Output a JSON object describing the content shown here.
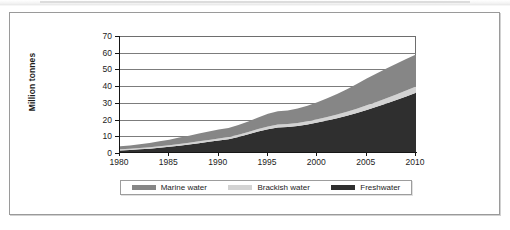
{
  "chart_data": {
    "type": "area",
    "stacked": true,
    "title": "",
    "subtitle": "",
    "xlabel": "",
    "ylabel": "Million tonnes",
    "xlim": [
      1980,
      2010
    ],
    "ylim": [
      0,
      70
    ],
    "grid": true,
    "legend_position": "bottom",
    "x_tick_labels": [
      "1980",
      "1985",
      "1990",
      "1995",
      "2000",
      "2005",
      "2010"
    ],
    "x_ticks": [
      1980,
      1985,
      1990,
      1995,
      2000,
      2005,
      2010
    ],
    "y_tick_labels": [
      "0",
      "10",
      "20",
      "30",
      "40",
      "50",
      "60",
      "70"
    ],
    "y_ticks": [
      0,
      10,
      20,
      30,
      40,
      50,
      60,
      70
    ],
    "x": [
      1980,
      1981,
      1982,
      1983,
      1984,
      1985,
      1986,
      1987,
      1988,
      1989,
      1990,
      1991,
      1992,
      1993,
      1994,
      1995,
      1996,
      1997,
      1998,
      1999,
      2000,
      2001,
      2002,
      2003,
      2004,
      2005,
      2006,
      2007,
      2008,
      2009,
      2010
    ],
    "series": [
      {
        "name": "Freshwater",
        "color": "#2f2f2f",
        "values": [
          1.5,
          1.8,
          2.2,
          2.6,
          3.1,
          3.7,
          4.4,
          5.1,
          5.9,
          6.7,
          7.5,
          8.3,
          9.6,
          11.2,
          12.8,
          14.2,
          15.3,
          15.6,
          16.2,
          17.1,
          18.2,
          19.4,
          20.8,
          22.3,
          24.0,
          25.8,
          27.6,
          29.6,
          31.7,
          33.8,
          36.0
        ]
      },
      {
        "name": "Brackish water",
        "color": "#d3d3d3",
        "values": [
          0.7,
          0.7,
          0.8,
          0.8,
          0.9,
          0.9,
          1.0,
          1.0,
          1.1,
          1.1,
          1.2,
          1.2,
          1.3,
          1.4,
          1.5,
          1.6,
          1.7,
          1.7,
          1.8,
          1.9,
          2.0,
          2.1,
          2.2,
          2.4,
          2.5,
          2.7,
          2.9,
          3.1,
          3.3,
          3.6,
          3.8
        ]
      },
      {
        "name": "Marine water",
        "color": "#868686",
        "values": [
          1.8,
          2.0,
          2.3,
          2.6,
          3.0,
          3.4,
          3.8,
          4.2,
          4.6,
          5.0,
          5.3,
          5.5,
          5.8,
          6.3,
          6.9,
          7.7,
          8.0,
          8.2,
          8.6,
          9.3,
          10.2,
          11.2,
          12.3,
          13.5,
          14.8,
          16.0,
          17.0,
          17.8,
          18.4,
          18.9,
          19.2
        ]
      }
    ],
    "totals": [
      4.0,
      4.5,
      5.3,
      6.0,
      7.0,
      8.0,
      9.2,
      10.3,
      11.6,
      12.8,
      14.0,
      15.0,
      16.7,
      18.9,
      21.2,
      23.5,
      25.0,
      25.5,
      26.6,
      28.3,
      30.4,
      32.7,
      35.3,
      38.2,
      41.3,
      44.5,
      47.5,
      50.5,
      53.4,
      56.3,
      59.0
    ]
  },
  "legend": {
    "items": [
      {
        "label": "Marine water",
        "color": "#868686"
      },
      {
        "label": "Brackish water",
        "color": "#d3d3d3"
      },
      {
        "label": "Freshwater",
        "color": "#2f2f2f"
      }
    ]
  },
  "axis": {
    "y_title": "Million tonnes"
  },
  "colors": {
    "marine": "#868686",
    "brackish": "#d3d3d3",
    "freshwater": "#2f2f2f",
    "grid": "#7c7c7c",
    "axis": "#161616",
    "frame": "#9a9a9a"
  }
}
